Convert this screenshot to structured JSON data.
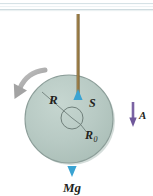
{
  "figure": {
    "type": "physics-free-body-diagram",
    "background_color": "#ffffff"
  },
  "scan_edge": {
    "name": "page-edge-line",
    "color": "#c8d4d8",
    "secondary_color": "#e4ecef"
  },
  "rod": {
    "name": "vertical-rod",
    "color": "#8a6d3b",
    "highlight_color": "#b79a66",
    "x": 78,
    "top_y": 14,
    "bottom_y": 96,
    "width": 3
  },
  "disk": {
    "name": "disk-body",
    "center_x": 69,
    "center_y": 119,
    "radius": 44,
    "fill": "#b6c9c2",
    "stroke": "#8c9e99",
    "shadow": "#9fb3ac"
  },
  "hub": {
    "name": "inner-hub-circle",
    "center_x": 72,
    "center_y": 118,
    "radius": 11,
    "stroke": "#6f7f7a"
  },
  "arrows": {
    "tension": {
      "name": "tension-arrow",
      "label": "S",
      "color": "#2f9fd0",
      "direction": "up",
      "x": 78,
      "tail_y": 122,
      "head_y": 90
    },
    "weight": {
      "name": "weight-arrow",
      "label": "Mg",
      "color": "#2f9fd0",
      "direction": "down",
      "x": 72,
      "tail_y": 114,
      "head_y": 176
    },
    "acceleration": {
      "name": "acceleration-arrow",
      "label": "A",
      "color": "#7b63a3",
      "direction": "down",
      "x": 133,
      "tail_y": 103,
      "head_y": 126
    },
    "rotation": {
      "name": "rotation-direction-arrow",
      "color": "#a8a8a8",
      "direction": "counterclockwise-down-left"
    }
  },
  "labels": {
    "radius_outer": {
      "name": "radius-R-label",
      "text": "R",
      "x": 49,
      "y": 104
    },
    "radius_inner": {
      "name": "radius-R0-label",
      "text": "R",
      "subscript": "0",
      "x": 87,
      "y": 137
    },
    "tension": {
      "name": "tension-S-label",
      "text": "S",
      "x": 89,
      "y": 105
    },
    "acceleration": {
      "name": "acceleration-A-label",
      "text": "A",
      "x": 141,
      "y": 118
    },
    "weight": {
      "name": "weight-Mg-label",
      "text": "Mg",
      "x": 72,
      "y": 191
    }
  },
  "leader_lines": {
    "radius_outer": {
      "name": "radius-R-leader-line",
      "from_x": 42,
      "from_y": 92,
      "to_x": 72,
      "to_y": 118,
      "color": "#6f7f7a"
    },
    "radius_inner": {
      "name": "radius-R0-leader-line",
      "from_x": 72,
      "from_y": 118,
      "to_x": 86,
      "to_y": 131,
      "color": "#6f7f7a"
    }
  }
}
